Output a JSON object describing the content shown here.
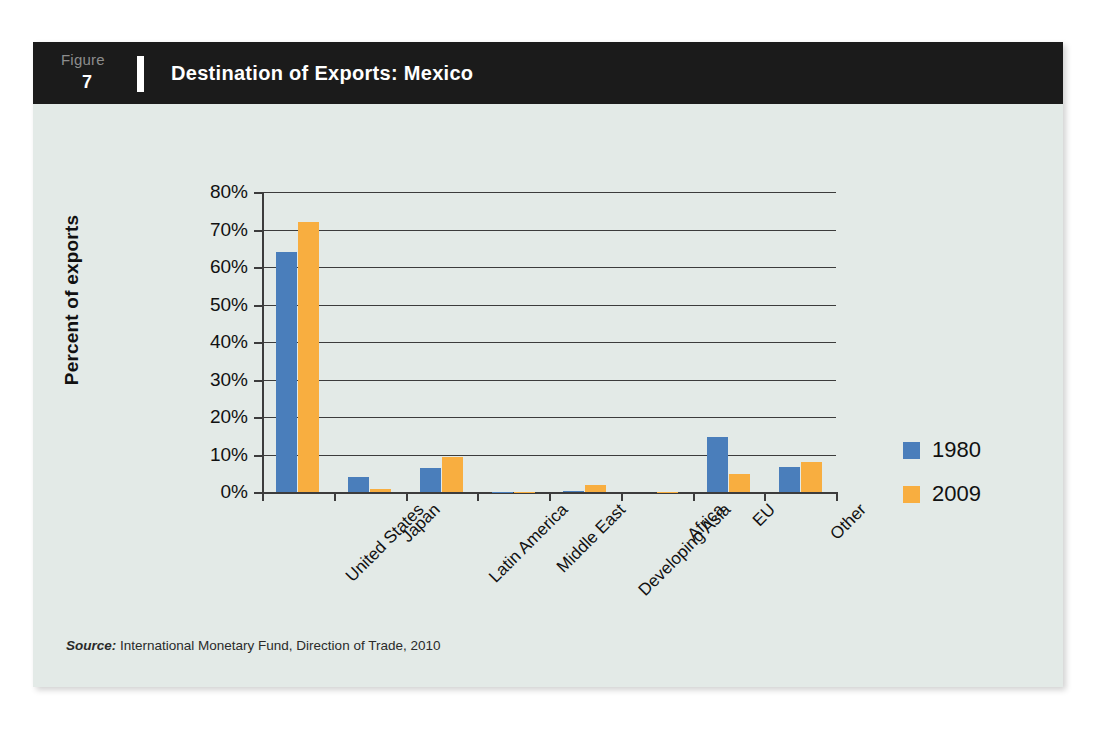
{
  "figure": {
    "label": "Figure",
    "number": "7",
    "title": "Destination of Exports: Mexico"
  },
  "source": {
    "prefix": "Source:",
    "text": " International Monetary Fund, Direction of Trade, 2010"
  },
  "legend": {
    "position": "right",
    "items": [
      {
        "label": "1980",
        "color": "#4a7ebb",
        "swatch_name": "legend-swatch-1980"
      },
      {
        "label": "2009",
        "color": "#f8ae40",
        "swatch_name": "legend-swatch-2009"
      }
    ]
  },
  "colors": {
    "card_background": "#e3eae7",
    "header_background": "#1b1b1b",
    "series_1980": "#4a7ebb",
    "series_2009": "#f8ae40",
    "axis": "#3c3c3c",
    "page_background": "#ffffff"
  },
  "chart_data": {
    "type": "bar",
    "title": "Destination of Exports: Mexico",
    "xlabel": "",
    "ylabel": "Percent of exports",
    "ylim": [
      0,
      80
    ],
    "yticks": [
      0,
      10,
      20,
      30,
      40,
      50,
      60,
      70,
      80
    ],
    "ytick_labels": [
      "0%",
      "10%",
      "20%",
      "30%",
      "40%",
      "50%",
      "60%",
      "70%",
      "80%"
    ],
    "grid": true,
    "grid_axis": "y",
    "legend_position": "right",
    "categories": [
      "United States",
      "Japan",
      "Latin America",
      "Middle East",
      "Developing Asia",
      "Africa",
      "EU",
      "Other"
    ],
    "series": [
      {
        "name": "1980",
        "color": "#4a7ebb",
        "values": [
          64.0,
          4.0,
          6.5,
          0.1,
          0.4,
          0.0,
          14.8,
          6.8
        ]
      },
      {
        "name": "2009",
        "color": "#f8ae40",
        "values": [
          72.0,
          0.8,
          9.4,
          0.1,
          1.8,
          0.1,
          4.7,
          8.0
        ]
      }
    ]
  }
}
